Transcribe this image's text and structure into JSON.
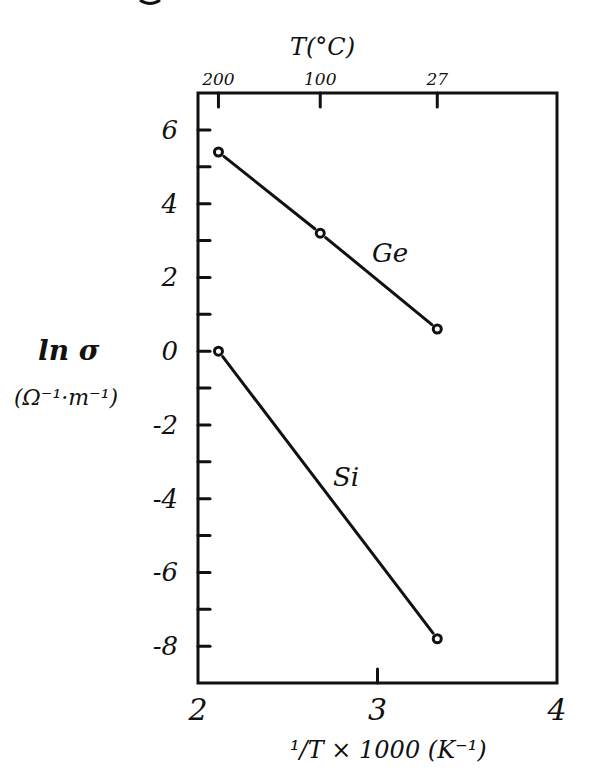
{
  "chart_data": {
    "type": "line",
    "title": "",
    "xlabel": "1/T x 1000 (K-1)",
    "ylabel": "ln σ",
    "ylabel_units": "(Ω-1·m-1)",
    "top_axis_label": "T(°C)",
    "xlim": [
      2,
      4
    ],
    "ylim": [
      -9,
      7
    ],
    "x_ticks": [
      "2",
      "3",
      "4"
    ],
    "y_ticks": [
      "6",
      "4",
      "2",
      "0",
      "-2",
      "-4",
      "-6",
      "-8"
    ],
    "top_ticks": [
      {
        "label": "200",
        "x": 2.114
      },
      {
        "label": "100",
        "x": 2.681
      },
      {
        "label": "27",
        "x": 3.333
      }
    ],
    "grid": false,
    "legend": null,
    "series": [
      {
        "name": "Ge",
        "x": [
          2.114,
          2.681,
          3.333
        ],
        "values": [
          5.4,
          3.2,
          0.6
        ]
      },
      {
        "name": "Si",
        "x": [
          2.114,
          3.333
        ],
        "values": [
          0.0,
          -7.8
        ]
      }
    ],
    "annotations": [
      "Ge",
      "Si"
    ]
  },
  "labels": {
    "y_main": "ln σ",
    "y_units": "(Ω⁻¹·m⁻¹)",
    "x_main": "¹/T × 1000 (K⁻¹)",
    "top_title": "T(°C)",
    "ge": "Ge",
    "si": "Si"
  }
}
